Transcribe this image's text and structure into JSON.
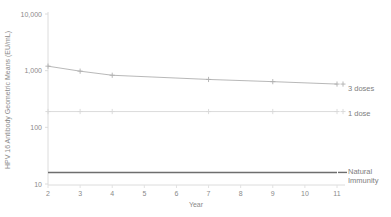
{
  "chart_data": {
    "type": "line",
    "title": "",
    "xlabel": "Year",
    "ylabel": "HPV 16 Antibody Geometric Means (EU/mL)",
    "yscale": "log",
    "ylim": [
      10,
      10000
    ],
    "xlim": [
      2,
      11
    ],
    "grid": false,
    "legend_position": "right-inline",
    "ytick_labels": [
      "10,000",
      "1,000",
      "100",
      "10"
    ],
    "ytick_values": [
      10000,
      1000,
      100,
      10
    ],
    "xtick_labels": [
      "2",
      "3",
      "4",
      "5",
      "6",
      "7",
      "8",
      "9",
      "10",
      "11"
    ],
    "xtick_values": [
      2,
      3,
      4,
      5,
      6,
      7,
      8,
      9,
      10,
      11
    ],
    "x": [
      2,
      3,
      4,
      7,
      9,
      11
    ],
    "series": [
      {
        "name": "3 doses",
        "label": "3 doses",
        "color": "#b0b0b0",
        "marker": "plus",
        "x": [
          2,
          3,
          4,
          7,
          9,
          11
        ],
        "values": [
          1200,
          980,
          830,
          700,
          640,
          580
        ]
      },
      {
        "name": "1 dose",
        "label": "1 dose",
        "color": "#d8d8d8",
        "marker": "plus",
        "x": [
          2,
          3,
          4,
          7,
          9,
          11
        ],
        "values": [
          190,
          190,
          190,
          190,
          190,
          190
        ]
      },
      {
        "name": "Natural Immunity",
        "label_line1": "Natural",
        "label_line2": "Immunity",
        "color": "#6e6e6e",
        "marker": "none",
        "x": [
          2,
          11
        ],
        "values": [
          16,
          16
        ]
      }
    ]
  },
  "axes": {
    "y_title": "HPV 16 Antibody Geometric Means (EU/mL)",
    "x_title": "Year",
    "y_ticks": [
      {
        "label": "10,000"
      },
      {
        "label": "1,000"
      },
      {
        "label": "100"
      },
      {
        "label": "10"
      }
    ],
    "x_ticks": [
      {
        "label": "2"
      },
      {
        "label": "3"
      },
      {
        "label": "4"
      },
      {
        "label": "5"
      },
      {
        "label": "6"
      },
      {
        "label": "7"
      },
      {
        "label": "8"
      },
      {
        "label": "9"
      },
      {
        "label": "10"
      },
      {
        "label": "11"
      }
    ]
  },
  "legend": {
    "three_doses": "3 doses",
    "one_dose": "1 dose",
    "natural_immunity_line1": "Natural",
    "natural_immunity_line2": "Immunity"
  },
  "colors": {
    "axis": "#d9d9d9",
    "three_doses": "#b0b0b0",
    "one_dose": "#d8d8d8",
    "natural_immunity": "#6e6e6e",
    "text": "#8a8a8a",
    "background": "#ffffff"
  }
}
